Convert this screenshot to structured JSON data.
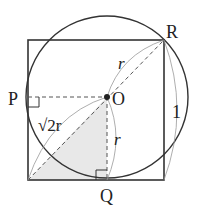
{
  "diagram": {
    "type": "geometry",
    "points": {
      "P": {
        "label": "P"
      },
      "O": {
        "label": "O"
      },
      "Q": {
        "label": "Q"
      },
      "R": {
        "label": "R"
      }
    },
    "measurements": {
      "r_upper": "r",
      "r_lower": "r",
      "diagonal": "√2r",
      "side": "1"
    },
    "colors": {
      "stroke": "#333333",
      "dashed": "#555555",
      "shade": "#e6e6e6",
      "thin_arc": "#888888"
    }
  }
}
